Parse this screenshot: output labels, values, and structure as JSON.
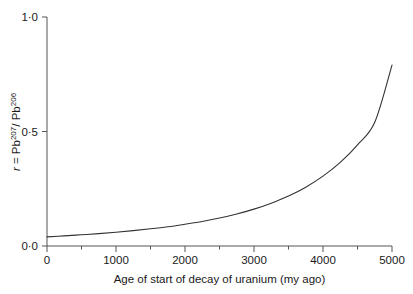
{
  "chart_data": {
    "type": "line",
    "title": "",
    "xlabel": "Age of start of decay of uranium (my ago)",
    "ylabel": "r = Pb207/ Pb206",
    "ylabel_parts": {
      "var": "r",
      "eq": " = ",
      "num_base": "Pb",
      "num_sup": "207",
      "slash": "/ ",
      "den_base": "Pb",
      "den_sup": "206"
    },
    "xlim": [
      0,
      5000
    ],
    "ylim": [
      0,
      1.0
    ],
    "grid": false,
    "legend": "none",
    "xticks": [
      0,
      1000,
      2000,
      3000,
      4000,
      5000
    ],
    "xticklabels": [
      "0",
      "1000",
      "2000",
      "3000",
      "4000",
      "5000"
    ],
    "xminorticks": [
      500,
      1500,
      2500,
      3500,
      4500
    ],
    "yticks": [
      0,
      0.5,
      1.0
    ],
    "yticklabels": [
      "0·0",
      "0·5",
      "1·0"
    ],
    "series": [
      {
        "name": "r = Pb207/Pb206 vs age",
        "x": [
          0,
          250,
          500,
          750,
          1000,
          1250,
          1500,
          1750,
          2000,
          2250,
          2500,
          2750,
          3000,
          3250,
          3500,
          3750,
          4000,
          4250,
          4500,
          4750,
          5000
        ],
        "values": [
          0.04,
          0.044,
          0.049,
          0.054,
          0.06,
          0.067,
          0.075,
          0.084,
          0.095,
          0.107,
          0.122,
          0.14,
          0.161,
          0.187,
          0.218,
          0.257,
          0.305,
          0.365,
          0.442,
          0.54,
          0.79
        ]
      }
    ],
    "line_color": "#333333",
    "axis_color": "#555555",
    "background": "#ffffff",
    "annotations": []
  },
  "layout": {
    "plot_left_px": 47,
    "plot_right_px": 392,
    "plot_top_px": 17,
    "plot_bottom_px": 246
  }
}
